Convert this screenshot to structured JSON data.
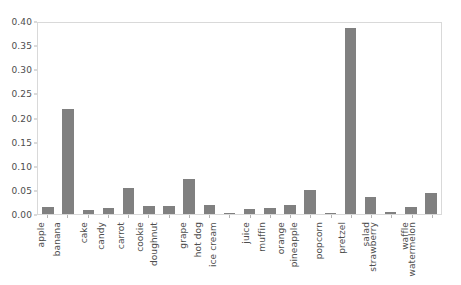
{
  "chart_data": {
    "type": "bar",
    "title": "",
    "xlabel": "",
    "ylabel": "",
    "ylim": [
      0.0,
      0.4
    ],
    "yticks": [
      "0.00",
      "0.05",
      "0.10",
      "0.15",
      "0.20",
      "0.25",
      "0.30",
      "0.35",
      "0.40"
    ],
    "ytick_values": [
      0.0,
      0.05,
      0.1,
      0.15,
      0.2,
      0.25,
      0.3,
      0.35,
      0.4
    ],
    "grid": false,
    "legend": null,
    "bar_color": "#808080",
    "categories": [
      "apple",
      "banana",
      "cake",
      "candy",
      "carrot",
      "cookie",
      "doughnut",
      "grape",
      "hot dog",
      "ice cream",
      "juice",
      "muffin",
      "orange",
      "pineapple",
      "popcorn",
      "pretzel",
      "salad",
      "strawberry",
      "waffle",
      "watermelon"
    ],
    "values": [
      0.014,
      0.217,
      0.008,
      0.013,
      0.054,
      0.017,
      0.016,
      0.072,
      0.019,
      0.002,
      0.011,
      0.012,
      0.018,
      0.049,
      0.003,
      0.385,
      0.035,
      0.005,
      0.015,
      0.043
    ]
  }
}
